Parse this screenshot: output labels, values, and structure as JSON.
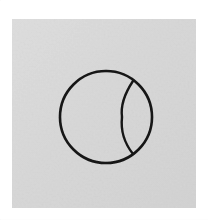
{
  "figure": {
    "title": "Circle with inner lens arc",
    "caption": "",
    "media_type": "scanned line drawing",
    "background_color": "#ffffff",
    "panel": {
      "name": "gray square panel",
      "fill_color": "#d9d9d9",
      "x": 12,
      "y": 19,
      "width": 184,
      "height": 189
    },
    "stroke_color": "#151515",
    "stroke_width": 2.6,
    "shapes": [
      {
        "id": "outer-circle",
        "type": "circle",
        "label": "main circle outline",
        "cx": 106,
        "cy": 117,
        "r": 46,
        "fill": "none"
      },
      {
        "id": "inner-arc",
        "type": "arc",
        "label": "lens arc on right side",
        "start_x": 133,
        "start_y": 81,
        "end_x": 133,
        "end_y": 154,
        "bulge_x": 122,
        "bulge_y": 117,
        "radius": 48,
        "sweep": 0,
        "fill": "none"
      }
    ]
  }
}
